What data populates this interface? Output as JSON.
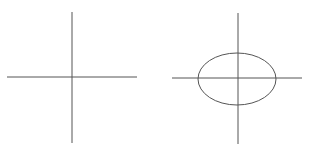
{
  "diagram": {
    "background": "#ffffff",
    "stroke_color": "#555555",
    "panels": [
      {
        "name": "axes-only",
        "axes": {
          "horizontal": {
            "x1": 7,
            "y1": 77,
            "x2": 137,
            "y2": 77
          },
          "vertical": {
            "x1": 72,
            "y1": 12,
            "x2": 72,
            "y2": 143
          }
        }
      },
      {
        "name": "axes-with-ellipse",
        "axes": {
          "horizontal": {
            "x1": 172,
            "y1": 78,
            "x2": 302,
            "y2": 78
          },
          "vertical": {
            "x1": 238,
            "y1": 13,
            "x2": 238,
            "y2": 144
          }
        },
        "ellipse": {
          "cx": 237,
          "cy": 79,
          "rx": 39,
          "ry": 26
        }
      }
    ]
  }
}
